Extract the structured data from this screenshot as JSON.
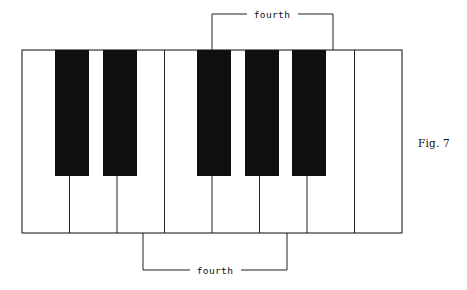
{
  "figure": {
    "caption": "Fig. 7",
    "caption_x": 418,
    "caption_y": 137,
    "background_color": "#ffffff",
    "line_color": "#222222",
    "black_key_color": "#101010",
    "white_key_color": "#ffffff"
  },
  "keyboard": {
    "description": "Piano keyboard octave diagram showing two fourth intervals",
    "left": 22,
    "top": 50,
    "right": 402,
    "bottom": 233,
    "white_key_count": 8,
    "white_key_width": 47.5,
    "white_key_dividers": [
      69.5,
      117,
      164.5,
      212,
      259.5,
      307,
      354.5
    ],
    "black_key_count": 5,
    "black_key_top": 50,
    "black_key_bottom": 176,
    "black_key_width": 34,
    "black_keys": [
      {
        "name": "black-key-1",
        "x": 55
      },
      {
        "name": "black-key-2",
        "x": 103
      },
      {
        "name": "black-key-3",
        "x": 197
      },
      {
        "name": "black-key-4",
        "x": 245
      },
      {
        "name": "black-key-5",
        "x": 292
      }
    ]
  },
  "brackets": {
    "top": {
      "label": "fourth",
      "left_x": 212,
      "right_x": 333,
      "bar_y": 14,
      "tick_bottom_y": 50,
      "label_x": 272,
      "label_y": 17,
      "gap_half_width": 25
    },
    "bottom": {
      "label": "fourth",
      "left_x": 143,
      "right_x": 287,
      "bar_y": 270,
      "tick_top_y": 233,
      "label_x": 215,
      "label_y": 273,
      "gap_half_width": 25
    }
  }
}
